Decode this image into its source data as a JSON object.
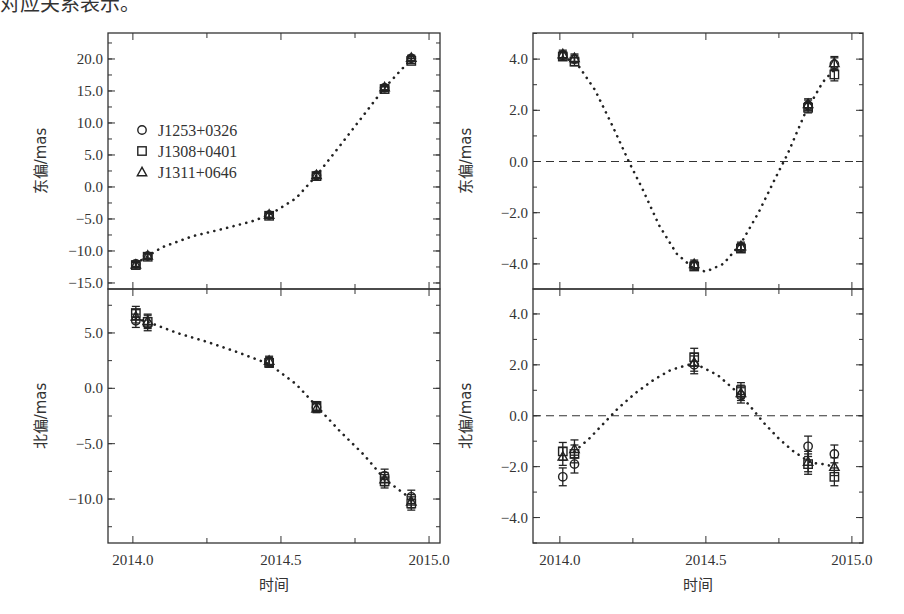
{
  "page": {
    "top_cut_text": "对应关系表示。"
  },
  "chart_data": [
    {
      "id": "east-left",
      "type": "scatter",
      "panel": "top-left",
      "title": "",
      "xlabel": "",
      "ylabel": "东偏/mas",
      "xlim": [
        2013.916,
        2015.037
      ],
      "ylim": [
        -15.94,
        24.06
      ],
      "xticks": [
        2014.0,
        2014.25,
        2014.5,
        2014.75,
        2015.0
      ],
      "xtick_labels": [],
      "yticks": [
        20.0,
        15.0,
        10.0,
        5.0,
        0.0,
        -5.0,
        -10.0,
        -15.0
      ],
      "ytick_labels": [
        "20.0",
        "15.0",
        "10.0",
        "5.0",
        "0.0",
        "−5.0",
        "−10.0",
        "−15.0"
      ],
      "yminor": 2.5,
      "grid": false,
      "zero_line": false,
      "legend": {
        "position": "upper-left",
        "entries": [
          {
            "marker": "circle",
            "label": "J1253+0326"
          },
          {
            "marker": "square",
            "label": "J1308+0401"
          },
          {
            "marker": "triangle",
            "label": "J1311+0646"
          }
        ]
      },
      "x": [
        2014.01,
        2014.05,
        2014.46,
        2014.62,
        2014.85,
        2014.94
      ],
      "series": [
        {
          "name": "J1253+0326",
          "marker": "circle",
          "values": [
            -12.0,
            -10.8,
            -4.4,
            1.8,
            15.5,
            20.1
          ],
          "err": [
            0.4,
            0.4,
            0.4,
            0.4,
            0.4,
            0.4
          ]
        },
        {
          "name": "J1308+0401",
          "marker": "square",
          "values": [
            -12.2,
            -10.9,
            -4.5,
            1.7,
            15.3,
            19.7
          ],
          "err": [
            0.4,
            0.4,
            0.4,
            0.4,
            0.4,
            0.4
          ]
        },
        {
          "name": "J1311+0646",
          "marker": "triangle",
          "values": [
            -12.1,
            -10.7,
            -4.3,
            1.9,
            15.6,
            20.2
          ],
          "err": [
            0.4,
            0.4,
            0.4,
            0.4,
            0.4,
            0.4
          ]
        }
      ],
      "fit_curve": {
        "style": "dotted",
        "x": [
          2014.01,
          2014.05,
          2014.1,
          2014.2,
          2014.3,
          2014.4,
          2014.46,
          2014.55,
          2014.62,
          2014.7,
          2014.78,
          2014.85,
          2014.9,
          2014.94
        ],
        "y": [
          -12.0,
          -10.8,
          -9.4,
          -7.7,
          -6.6,
          -5.4,
          -4.4,
          -1.8,
          1.8,
          6.5,
          11.3,
          15.5,
          18.0,
          20.0
        ]
      }
    },
    {
      "id": "north-left",
      "type": "scatter",
      "panel": "bottom-left",
      "xlabel": "时间",
      "ylabel": "北偏/mas",
      "xlim": [
        2013.916,
        2015.037
      ],
      "ylim": [
        -13.97,
        8.97
      ],
      "xticks": [
        2014.0,
        2014.25,
        2014.5,
        2014.75,
        2015.0
      ],
      "xtick_labels": [
        "2014.0",
        "",
        "2014.5",
        "",
        "2015.0"
      ],
      "yticks": [
        5.0,
        0.0,
        -5.0,
        -10.0
      ],
      "ytick_labels": [
        "5.0",
        "0.0",
        "−5.0",
        "−10.0"
      ],
      "yminor": 2.5,
      "grid": false,
      "zero_line": false,
      "x": [
        2014.01,
        2014.05,
        2014.46,
        2014.62,
        2014.85,
        2014.94
      ],
      "series": [
        {
          "name": "J1253+0326",
          "marker": "circle",
          "values": [
            6.1,
            5.8,
            2.4,
            -1.7,
            -7.9,
            -9.8
          ],
          "err": [
            0.6,
            0.6,
            0.4,
            0.4,
            0.6,
            0.6
          ]
        },
        {
          "name": "J1308+0401",
          "marker": "square",
          "values": [
            6.8,
            6.0,
            2.3,
            -1.6,
            -8.4,
            -10.4
          ],
          "err": [
            0.6,
            0.6,
            0.4,
            0.4,
            0.6,
            0.6
          ]
        },
        {
          "name": "J1311+0646",
          "marker": "triangle",
          "values": [
            6.5,
            6.1,
            2.5,
            -1.8,
            -8.2,
            -10.2
          ],
          "err": [
            0.6,
            0.6,
            0.4,
            0.4,
            0.6,
            0.6
          ]
        }
      ],
      "fit_curve": {
        "style": "dotted",
        "x": [
          2014.01,
          2014.05,
          2014.15,
          2014.25,
          2014.35,
          2014.46,
          2014.55,
          2014.62,
          2014.7,
          2014.78,
          2014.85,
          2014.9,
          2014.94
        ],
        "y": [
          6.3,
          6.0,
          5.0,
          4.2,
          3.3,
          2.2,
          0.4,
          -1.6,
          -3.9,
          -6.0,
          -8.2,
          -9.2,
          -10.0
        ]
      }
    },
    {
      "id": "east-right",
      "type": "scatter",
      "panel": "top-right",
      "xlabel": "",
      "ylabel": "东偏/mas",
      "xlim": [
        2013.908,
        2015.038
      ],
      "ylim": [
        -4.98,
        5.02
      ],
      "xticks": [
        2014.0,
        2014.25,
        2014.5,
        2014.75,
        2015.0
      ],
      "xtick_labels": [],
      "yticks": [
        4.0,
        2.0,
        0.0,
        -2.0,
        -4.0
      ],
      "ytick_labels": [
        "4.0",
        "2.0",
        "0.0",
        "−2.0",
        "−4.0"
      ],
      "yminor": 1.0,
      "grid": false,
      "zero_line": true,
      "x": [
        2014.01,
        2014.05,
        2014.46,
        2014.62,
        2014.85,
        2014.94
      ],
      "series": [
        {
          "name": "J1253+0326",
          "marker": "circle",
          "values": [
            4.15,
            4.0,
            -4.05,
            -3.35,
            2.2,
            3.8
          ],
          "err": [
            0.15,
            0.15,
            0.15,
            0.15,
            0.2,
            0.25
          ]
        },
        {
          "name": "J1308+0401",
          "marker": "square",
          "values": [
            4.1,
            3.9,
            -4.1,
            -3.4,
            2.1,
            3.4
          ],
          "err": [
            0.15,
            0.15,
            0.15,
            0.15,
            0.2,
            0.25
          ]
        },
        {
          "name": "J1311+0646",
          "marker": "triangle",
          "values": [
            4.2,
            4.05,
            -4.0,
            -3.3,
            2.25,
            3.85
          ],
          "err": [
            0.15,
            0.15,
            0.15,
            0.15,
            0.2,
            0.25
          ]
        }
      ],
      "fit_curve": {
        "style": "dotted",
        "x": [
          2014.01,
          2014.06,
          2014.12,
          2014.18,
          2014.24,
          2014.28,
          2014.34,
          2014.4,
          2014.46,
          2014.5,
          2014.56,
          2014.62,
          2014.68,
          2014.74,
          2014.78,
          2014.84,
          2014.9,
          2014.94
        ],
        "y": [
          4.1,
          3.8,
          2.8,
          1.4,
          -0.1,
          -1.0,
          -2.5,
          -3.6,
          -4.2,
          -4.3,
          -4.0,
          -3.2,
          -2.0,
          -0.6,
          0.3,
          1.9,
          3.1,
          3.6
        ]
      }
    },
    {
      "id": "north-right",
      "type": "scatter",
      "panel": "bottom-right",
      "xlabel": "时间",
      "ylabel": "北偏/mas",
      "xlim": [
        2013.908,
        2015.038
      ],
      "ylim": [
        -5.0,
        4.98
      ],
      "xticks": [
        2014.0,
        2014.25,
        2014.5,
        2014.75,
        2015.0
      ],
      "xtick_labels": [
        "2014.0",
        "",
        "2014.5",
        "",
        "2015.0"
      ],
      "yticks": [
        4.0,
        2.0,
        0.0,
        -2.0,
        -4.0
      ],
      "ytick_labels": [
        "4.0",
        "2.0",
        "0.0",
        "−2.0",
        "−4.0"
      ],
      "yminor": 1.0,
      "grid": false,
      "zero_line": true,
      "x": [
        2014.01,
        2014.05,
        2014.46,
        2014.62,
        2014.85,
        2014.94
      ],
      "series": [
        {
          "name": "J1253+0326",
          "marker": "circle",
          "values": [
            -2.4,
            -1.9,
            2.0,
            0.8,
            -1.2,
            -1.5
          ],
          "err": [
            0.35,
            0.35,
            0.35,
            0.3,
            0.4,
            0.35
          ]
        },
        {
          "name": "J1308+0401",
          "marker": "square",
          "values": [
            -1.4,
            -1.5,
            2.3,
            1.0,
            -1.9,
            -2.4
          ],
          "err": [
            0.35,
            0.35,
            0.35,
            0.3,
            0.4,
            0.35
          ]
        },
        {
          "name": "J1311+0646",
          "marker": "triangle",
          "values": [
            -1.6,
            -1.3,
            2.1,
            0.9,
            -1.8,
            -2.0
          ],
          "err": [
            0.35,
            0.35,
            0.35,
            0.3,
            0.4,
            0.35
          ]
        }
      ],
      "fit_curve": {
        "style": "dotted",
        "x": [
          2014.05,
          2014.1,
          2014.15,
          2014.2,
          2014.26,
          2014.32,
          2014.38,
          2014.44,
          2014.48,
          2014.54,
          2014.6,
          2014.65,
          2014.7,
          2014.75,
          2014.8,
          2014.86,
          2014.9,
          2014.94
        ],
        "y": [
          -1.4,
          -0.9,
          -0.3,
          0.3,
          0.9,
          1.4,
          1.8,
          2.0,
          1.95,
          1.6,
          1.0,
          0.4,
          -0.3,
          -0.9,
          -1.4,
          -1.85,
          -1.9,
          -2.0
        ]
      }
    }
  ],
  "layout_panels": {
    "top-left": {
      "x0": 108,
      "x1": 440,
      "y0": 33,
      "y1": 289
    },
    "bottom-left": {
      "x0": 108,
      "x1": 440,
      "y0": 289,
      "y1": 543
    },
    "top-right": {
      "x0": 533,
      "x1": 863,
      "y0": 33,
      "y1": 289
    },
    "bottom-right": {
      "x0": 533,
      "x1": 863,
      "y0": 289,
      "y1": 543
    }
  }
}
